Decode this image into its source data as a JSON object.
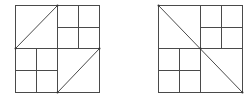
{
  "figures": [
    {
      "id": "figure-left",
      "description": "Square divided into 4 quadrants; top-right and bottom-left quadrants subdivided into 4 cells; top-left and bottom-right quadrants each split by one diagonal",
      "subdivided_quadrants": [
        "top-right",
        "bottom-left"
      ],
      "diagonals": [
        {
          "quadrant": "top-left",
          "from": "top-right-corner",
          "to": "bottom-left-corner"
        },
        {
          "quadrant": "bottom-right",
          "from": "top-right-corner",
          "to": "bottom-left-corner"
        }
      ]
    },
    {
      "id": "figure-right",
      "description": "Square divided into 4 quadrants; top-right and bottom-left quadrants subdivided into 4 cells; one main diagonal from top-left corner to bottom-right corner",
      "subdivided_quadrants": [
        "top-right",
        "bottom-left"
      ],
      "diagonals": [
        {
          "quadrant": "whole",
          "from": "top-left-corner",
          "to": "bottom-right-corner"
        }
      ]
    }
  ],
  "colors": {
    "line": "#4a4a4a",
    "background": "#ffffff"
  }
}
